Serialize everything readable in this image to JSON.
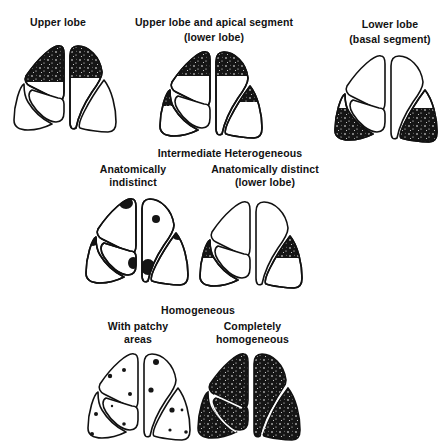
{
  "title_sections": {
    "top_row": [
      {
        "label_lines": [
          "Upper lobe"
        ]
      },
      {
        "label_lines": [
          "Upper lobe and apical segment",
          "(lower lobe)"
        ]
      },
      {
        "label_lines": [
          "Lower lobe",
          "(basal segment)"
        ]
      }
    ],
    "intermediate": {
      "heading": "Intermediate Heterogeneous",
      "items": [
        {
          "label_lines": [
            "Anatomically",
            "indistinct"
          ]
        },
        {
          "label_lines": [
            "Anatomically distinct",
            "(lower lobe)"
          ]
        }
      ]
    },
    "homogeneous": {
      "heading": "Homogeneous",
      "items": [
        {
          "label_lines": [
            "With patchy",
            "areas"
          ]
        },
        {
          "label_lines": [
            "Completely",
            "homogeneous"
          ]
        }
      ]
    }
  },
  "colors": {
    "ink": "#111111",
    "background": "#ffffff"
  }
}
